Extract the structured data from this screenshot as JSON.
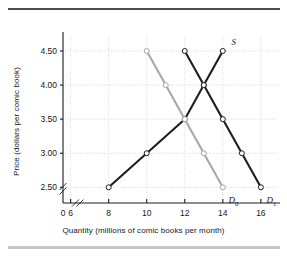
{
  "figure": {
    "name": "supply-and-demand-comic-books",
    "rules": {
      "top_color": "#4a4a52",
      "bottom_color": "#c8c6c4"
    }
  },
  "chart_data": {
    "type": "line",
    "title": "",
    "xlabel": "Quantity (millions of comic books per month)",
    "ylabel": "Price (dollars per comic book)",
    "xlim": [
      5,
      17
    ],
    "ylim": [
      2.25,
      4.75
    ],
    "x_ticks": [
      0,
      6,
      8,
      10,
      12,
      14,
      16
    ],
    "x_tick_labels": [
      "0",
      "6",
      "8",
      "10",
      "12",
      "14",
      "16"
    ],
    "y_ticks": [
      2.5,
      3.0,
      3.5,
      4.0,
      4.5
    ],
    "y_tick_labels": [
      "2.50",
      "3.00",
      "3.50",
      "4.00",
      "4.50"
    ],
    "axis_break_x": true,
    "axis_break_y": true,
    "grid": true,
    "grid_style": "dotted",
    "grid_color": "#bfbfc4",
    "legend": "inline-labels",
    "marker": "open-circle",
    "series": [
      {
        "name": "S",
        "label": "S",
        "role": "supply",
        "color": "#1d1d22",
        "label_pos": {
          "x": 14.45,
          "y": 4.62
        },
        "points": [
          {
            "x": 8,
            "y": 2.5
          },
          {
            "x": 10,
            "y": 3.0
          },
          {
            "x": 12,
            "y": 3.5
          },
          {
            "x": 13,
            "y": 4.0
          },
          {
            "x": 14,
            "y": 4.5
          }
        ]
      },
      {
        "name": "D0",
        "label": "D",
        "sublabel": "0",
        "role": "demand-original",
        "color": "#a7a7ad",
        "label_pos": {
          "x": 14.3,
          "y": 2.3
        },
        "points": [
          {
            "x": 10,
            "y": 4.5
          },
          {
            "x": 11,
            "y": 4.0
          },
          {
            "x": 12,
            "y": 3.5
          },
          {
            "x": 13,
            "y": 3.0
          },
          {
            "x": 14,
            "y": 2.5
          }
        ]
      },
      {
        "name": "D1",
        "label": "D",
        "sublabel": "1",
        "role": "demand-new",
        "color": "#1d1d22",
        "label_pos": {
          "x": 16.3,
          "y": 2.3
        },
        "points": [
          {
            "x": 12,
            "y": 4.5
          },
          {
            "x": 13,
            "y": 4.0
          },
          {
            "x": 14,
            "y": 3.5
          },
          {
            "x": 15,
            "y": 3.0
          },
          {
            "x": 16,
            "y": 2.5
          }
        ]
      }
    ]
  }
}
